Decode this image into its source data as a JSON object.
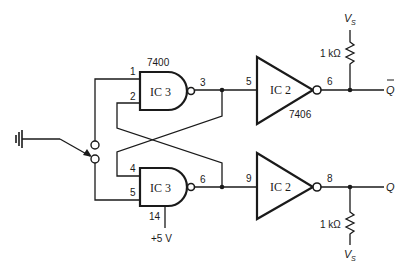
{
  "diagram": {
    "type": "schematic",
    "components": {
      "nand_top": {
        "ic": "IC 3",
        "part": "7400",
        "pins": {
          "in1": "1",
          "in2": "2",
          "out": "3"
        }
      },
      "nand_bottom": {
        "ic": "IC 3",
        "pins": {
          "in1": "4",
          "in2": "5",
          "out": "6",
          "vcc": "14"
        },
        "supply": "+5 V"
      },
      "inv_top": {
        "ic": "IC 2",
        "part": "7406",
        "pins": {
          "in": "5",
          "out": "6"
        }
      },
      "inv_bottom": {
        "ic": "IC 2",
        "pins": {
          "in": "9",
          "out": "8"
        }
      },
      "r_top": {
        "value": "1 kΩ",
        "supply": "V",
        "supply_sub": "S"
      },
      "r_bottom": {
        "value": "1 kΩ",
        "supply": "V",
        "supply_sub": "S"
      },
      "switch": {
        "type": "SPDT",
        "common": "ground"
      }
    },
    "outputs": {
      "q_bar": "Q",
      "q": "Q"
    }
  }
}
